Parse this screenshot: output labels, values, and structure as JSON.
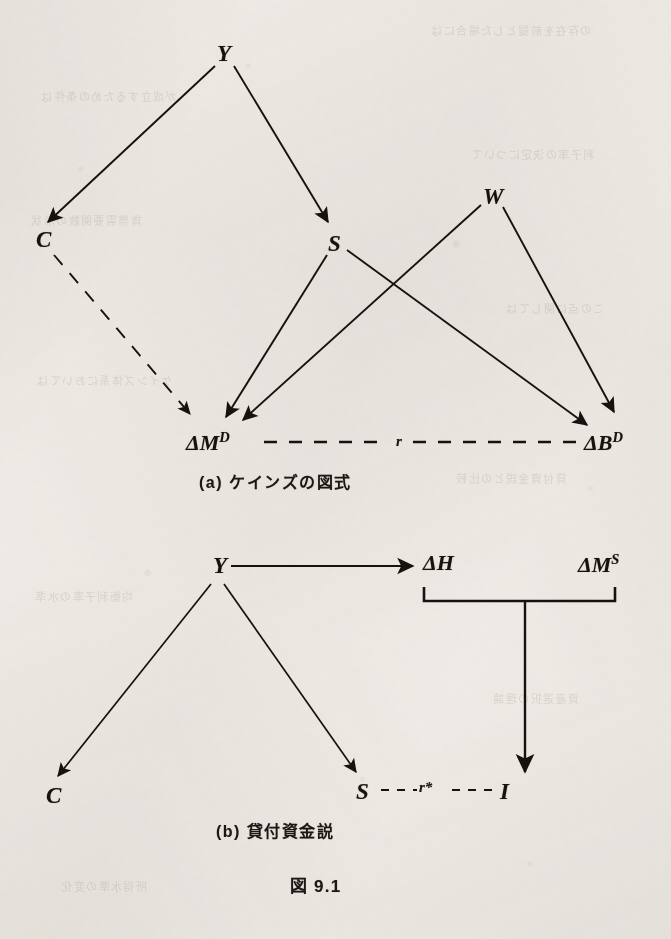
{
  "page": {
    "figure_number": "図 9.1",
    "background_color": "#eeebe6",
    "ink_color": "#16130f",
    "width": 671,
    "height": 939
  },
  "diagram_a": {
    "caption": "(a)  ケインズの図式",
    "nodes": {
      "y": "Y",
      "c": "C",
      "s": "S",
      "w": "W",
      "delta_m_d": "ΔM",
      "delta_m_d_sup": "D",
      "delta_b_d": "ΔB",
      "delta_b_d_sup": "D",
      "r": "r"
    },
    "edges": [
      {
        "from": "Y",
        "to": "C",
        "style": "solid-arrow"
      },
      {
        "from": "Y",
        "to": "S",
        "style": "solid-arrow"
      },
      {
        "from": "C",
        "to": "ΔM^D",
        "style": "dashed-arrow"
      },
      {
        "from": "S",
        "to": "ΔM^D",
        "style": "solid-arrow"
      },
      {
        "from": "S",
        "to": "ΔB^D",
        "style": "solid-arrow"
      },
      {
        "from": "W",
        "to": "ΔM^D",
        "style": "solid-arrow"
      },
      {
        "from": "W",
        "to": "ΔB^D",
        "style": "solid-arrow"
      },
      {
        "from": "ΔM^D",
        "to": "ΔB^D",
        "style": "dashed-line",
        "label": "r"
      }
    ]
  },
  "diagram_b": {
    "caption": "(b)  貸付資金説",
    "nodes": {
      "y": "Y",
      "c": "C",
      "s": "S",
      "i": "I",
      "r_star": "r*",
      "delta_h": "ΔH",
      "delta_m_s": "ΔM",
      "delta_m_s_sup": "S"
    },
    "edges": [
      {
        "from": "Y",
        "to": "ΔH",
        "style": "solid-arrow-horizontal"
      },
      {
        "from": "Y",
        "to": "C",
        "style": "solid-arrow"
      },
      {
        "from": "Y",
        "to": "S",
        "style": "solid-arrow"
      },
      {
        "from": "bracket(ΔH,ΔM^S)",
        "to": "I",
        "style": "solid-arrow-vertical"
      },
      {
        "from": "S",
        "to": "I",
        "style": "dashed-line",
        "label": "r*"
      }
    ],
    "bracket": {
      "spans": [
        "ΔH",
        "ΔM^S"
      ],
      "drop_to": "I"
    }
  },
  "bleed_text": [
    "の存在を前提とした場合には",
    "が成立するための条件は",
    "利子率の決定について",
    "貨幣需要関数の形状",
    "この点に関しては",
    "ケインズ体系においては",
    "貸付資金説との比較",
    "均衡利子率の水準",
    "資産選択の理論",
    "所得水準の変化"
  ]
}
